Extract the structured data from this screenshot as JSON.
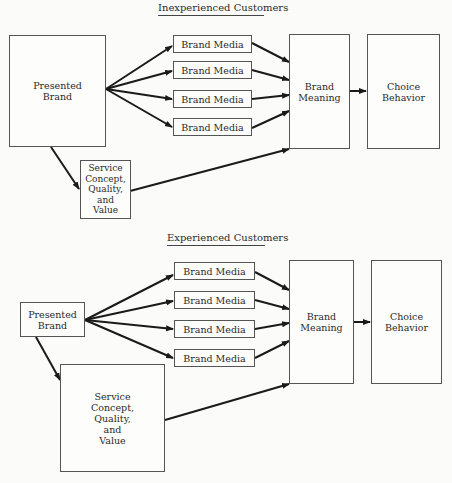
{
  "diagrams": [
    {
      "title": "Inexperienced Customers",
      "presented_brand": "Presented\nBrand",
      "brand_media": [
        "Brand Media",
        "Brand Media",
        "Brand Media",
        "Brand Media"
      ],
      "service": "Service\nConcept,\nQuality,\nand\nValue",
      "brand_meaning": "Brand\nMeaning",
      "choice_behavior": "Choice\nBehavior"
    },
    {
      "title": "Experienced Customers",
      "presented_brand": "Presented\nBrand",
      "brand_media": [
        "Brand Media",
        "Brand Media",
        "Brand Media",
        "Brand Media"
      ],
      "service": "Service\nConcept,\nQuality,\nand\nValue",
      "brand_meaning": "Brand\nMeaning",
      "choice_behavior": "Choice\nBehavior"
    }
  ],
  "colors": {
    "line": "#1a1a1a",
    "box_border": "#555555",
    "background": "#fbfbf9"
  }
}
